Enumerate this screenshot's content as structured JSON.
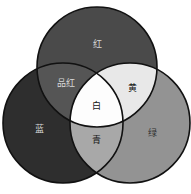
{
  "diagram": {
    "type": "venn-3-circle",
    "background_color": "#ffffff",
    "outline_color": "#111111",
    "circles": [
      {
        "id": "red",
        "label": "红",
        "position": "top",
        "cx": 97,
        "cy": 67,
        "r": 60,
        "fill": "#4a4a4a",
        "label_x": 97,
        "label_y": 44,
        "label_tone": "dark"
      },
      {
        "id": "blue",
        "label": "蓝",
        "position": "bottom-left",
        "cx": 63,
        "cy": 123,
        "r": 60,
        "fill": "#2e2e2e",
        "label_x": 39,
        "label_y": 129,
        "label_tone": "dark"
      },
      {
        "id": "green",
        "label": "绿",
        "position": "bottom-right",
        "cx": 130,
        "cy": 123,
        "r": 60,
        "fill": "#939393",
        "label_x": 152,
        "label_y": 133,
        "label_tone": "mid"
      }
    ],
    "intersections": [
      {
        "id": "magenta",
        "label": "品红",
        "of": [
          "red",
          "blue"
        ],
        "fill": "#555555",
        "label_x": 66,
        "label_y": 83,
        "label_tone": "dark"
      },
      {
        "id": "yellow",
        "label": "黄",
        "of": [
          "red",
          "green"
        ],
        "fill": "#e8e8e8",
        "label_x": 132,
        "label_y": 88,
        "label_tone": "light"
      },
      {
        "id": "cyan",
        "label": "青",
        "of": [
          "blue",
          "green"
        ],
        "fill": "#a8a8a8",
        "label_x": 96,
        "label_y": 140,
        "label_tone": "light"
      },
      {
        "id": "white",
        "label": "白",
        "of": [
          "red",
          "green",
          "blue"
        ],
        "fill": "#fdfdfd",
        "label_x": 96,
        "label_y": 106,
        "label_tone": "light"
      }
    ]
  }
}
